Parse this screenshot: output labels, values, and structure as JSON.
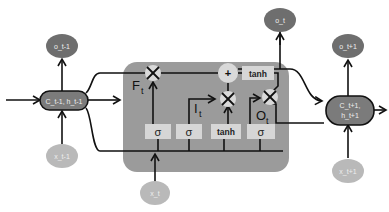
{
  "diagram": {
    "type": "LSTM cell",
    "colors": {
      "background": "#ffffff",
      "cell_box": "#9b9b9b",
      "state_node": "#7b7b7b",
      "output_node": "#6e6e6e",
      "input_node": "#b9b9b9",
      "gate_box": "#d6d6d6",
      "op_circle": "#d9d9d9",
      "line": "#111111",
      "node_text": "#eeeeee"
    },
    "nodes": {
      "prev_state": "C_t-1, h_t-1",
      "next_state_line1": "C_t+1,",
      "next_state_line2": "h_t+1",
      "prev_output": "o_t-1",
      "current_output": "o_t",
      "next_output": "o_t+1",
      "prev_input": "x_t-1",
      "current_input": "x_t",
      "next_input": "x_t+1"
    },
    "gates": [
      {
        "label": "σ",
        "name": "forget"
      },
      {
        "label": "σ",
        "name": "input"
      },
      {
        "label": "tanh",
        "name": "candidate"
      },
      {
        "label": "σ",
        "name": "output"
      }
    ],
    "gate_labels": {
      "forget": "F",
      "forget_sub": "t",
      "input": "I",
      "input_sub": "t",
      "output": "O",
      "output_sub": "t"
    },
    "operations": {
      "multiply": "×",
      "add": "+",
      "tanh": "tanh"
    }
  }
}
